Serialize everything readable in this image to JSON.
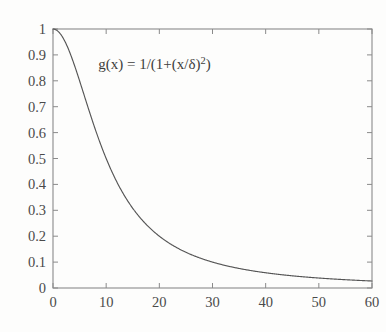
{
  "chart_data": {
    "type": "line",
    "title": "",
    "subtitle": "",
    "xlabel": "",
    "ylabel": "",
    "xlim": [
      0,
      60
    ],
    "ylim": [
      0,
      1
    ],
    "grid": false,
    "legend": null,
    "annotations": [
      {
        "name": "formula-annotation",
        "text": "g(x) = 1/(1+(x/δ)²)",
        "text_parts": {
          "main": "g(x)  =  1/(1+(x/δ)",
          "superscript": "2",
          "tail": ")"
        },
        "x_data": 8.5,
        "y_data": 0.845
      }
    ],
    "xticks": [
      0,
      10,
      20,
      30,
      40,
      50,
      60
    ],
    "xticklabels": [
      "0",
      "10",
      "20",
      "30",
      "40",
      "50",
      "60"
    ],
    "yticks": [
      0,
      0.1,
      0.2,
      0.3,
      0.4,
      0.5,
      0.6,
      0.7,
      0.8,
      0.9,
      1
    ],
    "yticklabels": [
      "0",
      "0.1",
      "0.2",
      "0.3",
      "0.4",
      "0.5",
      "0.6",
      "0.7",
      "0.8",
      "0.9",
      "1"
    ],
    "series": [
      {
        "name": "g(x)",
        "formula": "1/(1+(x/delta)^2)",
        "delta": 10,
        "color": "#555555",
        "x": [
          0,
          1,
          2,
          3,
          4,
          5,
          6,
          7,
          8,
          9,
          10,
          11,
          12,
          13,
          14,
          15,
          16,
          17,
          18,
          19,
          20,
          22,
          24,
          26,
          28,
          30,
          32,
          34,
          36,
          38,
          40,
          42,
          44,
          46,
          48,
          50,
          52,
          54,
          56,
          58,
          60
        ],
        "values": [
          1.0,
          0.99,
          0.962,
          0.917,
          0.862,
          0.8,
          0.735,
          0.671,
          0.61,
          0.552,
          0.5,
          0.452,
          0.41,
          0.372,
          0.338,
          0.308,
          0.281,
          0.257,
          0.236,
          0.217,
          0.2,
          0.171,
          0.148,
          0.129,
          0.113,
          0.1,
          0.089,
          0.08,
          0.072,
          0.065,
          0.059,
          0.054,
          0.049,
          0.045,
          0.042,
          0.038,
          0.036,
          0.033,
          0.031,
          0.029,
          0.027
        ]
      }
    ],
    "colors": {
      "curve": "#555555",
      "axis": "#8a8a8a",
      "text": "#4a4a4a",
      "background": "#fdfdfc"
    }
  }
}
